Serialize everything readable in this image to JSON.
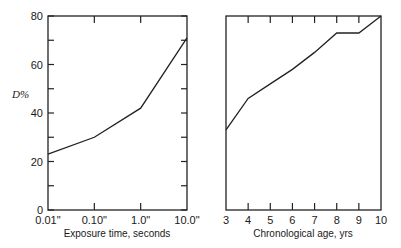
{
  "chart_data": [
    {
      "type": "line",
      "title": "",
      "xlabel": "Exposure time, seconds",
      "ylabel": "D%",
      "x_scale": "log",
      "categories": [
        "0.01\"",
        "0.10\"",
        "1.0\"",
        "10.0\""
      ],
      "x": [
        0.01,
        0.1,
        1.0,
        10.0
      ],
      "values": [
        23,
        30,
        42,
        71
      ],
      "ylim": [
        0,
        80
      ],
      "yticks": [
        0,
        20,
        40,
        60,
        80
      ],
      "y_minor_ticks": [
        10,
        30,
        50,
        70
      ],
      "grid": false,
      "legend": null
    },
    {
      "type": "line",
      "title": "",
      "xlabel": "Chronological age, yrs",
      "ylabel": "D%",
      "categories": [
        "3",
        "4",
        "5",
        "6",
        "7",
        "8",
        "9",
        "10"
      ],
      "x": [
        3,
        4,
        5,
        6,
        7,
        8,
        9,
        10
      ],
      "values": [
        33,
        46,
        52,
        58,
        65,
        73,
        73,
        80
      ],
      "ylim": [
        0,
        80
      ],
      "grid": false,
      "legend": null
    }
  ],
  "labels": {
    "ylabel": "D%",
    "left_xlabel": "Exposure time, seconds",
    "right_xlabel": "Chronological age, yrs",
    "left_yticks": [
      "0",
      "20",
      "40",
      "60",
      "80"
    ],
    "left_xticks": [
      "0.01\"",
      "0.10\"",
      "1.0\"",
      "10.0\""
    ],
    "right_xticks": [
      "3",
      "4",
      "5",
      "6",
      "7",
      "8",
      "9",
      "10"
    ]
  }
}
